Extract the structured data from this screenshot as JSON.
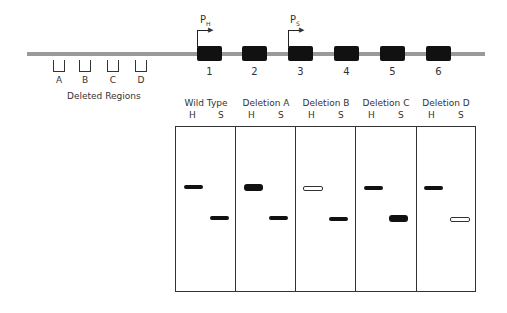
{
  "gene_map": {
    "exons": [
      {
        "label": "1",
        "x": 197
      },
      {
        "label": "2",
        "x": 242
      },
      {
        "label": "3",
        "x": 288
      },
      {
        "label": "4",
        "x": 334
      },
      {
        "label": "5",
        "x": 380
      },
      {
        "label": "6",
        "x": 426
      }
    ],
    "promoters": [
      {
        "label": "P",
        "sub": "H",
        "exon": "1"
      },
      {
        "label": "P",
        "sub": "S",
        "exon": "3"
      }
    ],
    "deleted_regions": {
      "title": "Deleted Regions",
      "items": [
        "A",
        "B",
        "C",
        "D"
      ]
    }
  },
  "gel": {
    "lanes": [
      {
        "title": "Wild Type",
        "h": "H",
        "s": "S",
        "h_band": "normal",
        "s_band": "normal"
      },
      {
        "title": "Deletion A",
        "h": "H",
        "s": "S",
        "h_band": "thick",
        "s_band": "normal"
      },
      {
        "title": "Deletion B",
        "h": "H",
        "s": "S",
        "h_band": "faint",
        "s_band": "normal"
      },
      {
        "title": "Deletion C",
        "h": "H",
        "s": "S",
        "h_band": "normal",
        "s_band": "thick"
      },
      {
        "title": "Deletion D",
        "h": "H",
        "s": "S",
        "h_band": "normal",
        "s_band": "faint"
      }
    ]
  }
}
